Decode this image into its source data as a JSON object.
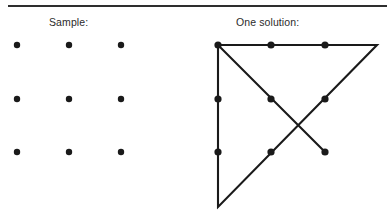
{
  "figure": {
    "background_color": "#ffffff",
    "ink_color": "#1a1a1a",
    "rule_color": "#2e2e2e",
    "has_top_rule": true,
    "panels": [
      {
        "id": "sample",
        "caption": "Sample:",
        "caption_x": 49,
        "caption_y": 16,
        "kind": "dot-grid",
        "dot_radius": 3.2,
        "dots": [
          {
            "label": "sample-dot-r1c1",
            "x": 17,
            "y": 45
          },
          {
            "label": "sample-dot-r1c2",
            "x": 69,
            "y": 45
          },
          {
            "label": "sample-dot-r1c3",
            "x": 121,
            "y": 45
          },
          {
            "label": "sample-dot-r2c1",
            "x": 17,
            "y": 99
          },
          {
            "label": "sample-dot-r2c2",
            "x": 69,
            "y": 99
          },
          {
            "label": "sample-dot-r2c3",
            "x": 121,
            "y": 99
          },
          {
            "label": "sample-dot-r3c1",
            "x": 17,
            "y": 152
          },
          {
            "label": "sample-dot-r3c2",
            "x": 69,
            "y": 152
          },
          {
            "label": "sample-dot-r3c3",
            "x": 121,
            "y": 152
          }
        ]
      },
      {
        "id": "solution",
        "caption": "One solution:",
        "caption_x": 236,
        "caption_y": 16,
        "kind": "dot-grid-with-path",
        "dot_radius": 3.6,
        "stroke_width": 2.1,
        "dots": [
          {
            "label": "solution-dot-r1c1",
            "x": 218,
            "y": 45
          },
          {
            "label": "solution-dot-r1c2",
            "x": 271,
            "y": 45
          },
          {
            "label": "solution-dot-r1c3",
            "x": 325,
            "y": 45
          },
          {
            "label": "solution-dot-r2c1",
            "x": 218,
            "y": 99
          },
          {
            "label": "solution-dot-r2c2",
            "x": 271,
            "y": 99
          },
          {
            "label": "solution-dot-r2c3",
            "x": 325,
            "y": 99
          },
          {
            "label": "solution-dot-r3c1",
            "x": 218,
            "y": 152
          },
          {
            "label": "solution-dot-r3c2",
            "x": 271,
            "y": 152
          },
          {
            "label": "solution-dot-r3c3",
            "x": 325,
            "y": 152
          }
        ],
        "path_points": [
          {
            "label": "start-top-left",
            "x": 218,
            "y": 45
          },
          {
            "label": "extend-top-right-outside",
            "x": 377,
            "y": 45
          },
          {
            "label": "turn-bottom-left-outside",
            "x": 218,
            "y": 207
          },
          {
            "label": "up-left-column-top",
            "x": 218,
            "y": 45
          },
          {
            "label": "diagonal-end-bottom-right",
            "x": 325,
            "y": 152
          }
        ],
        "path_description": "continuous 4-line stroke: top-left across top row past grid, back diagonally down-left to below bottom-left, up the left column to top-left, then diagonally down-right to the bottom-right dot"
      }
    ]
  }
}
